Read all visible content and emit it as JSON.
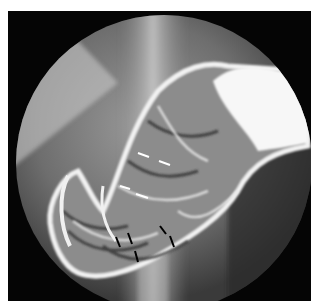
{
  "image": {
    "kind": "radiograph",
    "description": "Double-contrast barium fluoroscopic image of the stomach within circular field",
    "colors": {
      "background": "#ffffff",
      "frame": "#050505",
      "field_gray": "#7a7a7a",
      "barium": "#f4f4f4"
    },
    "annotations": {
      "white_arrows": 4,
      "black_arrows": 5
    }
  }
}
